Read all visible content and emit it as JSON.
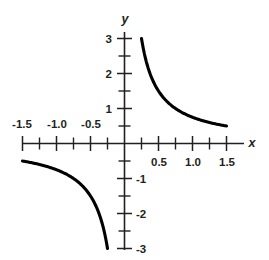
{
  "chart_data": {
    "type": "line",
    "title": "",
    "subtitle": "",
    "xlabel": "x",
    "ylabel": "y",
    "xlim": [
      -1.5,
      1.5
    ],
    "ylim": [
      -3,
      3
    ],
    "grid": false,
    "legend": null,
    "x_tick_labels": [
      "-1.5",
      "-1.0",
      "-0.5",
      "0.5",
      "1.0",
      "1.5"
    ],
    "x_tick_values": [
      -1.5,
      -1.0,
      -0.5,
      0.5,
      1.0,
      1.5
    ],
    "x_tick_label_side": {
      "negative": "above-axis",
      "positive": "below-axis"
    },
    "x_minor_tick_step": 0.25,
    "y_tick_labels": [
      "3",
      "2",
      "1",
      "-1",
      "-2",
      "-3"
    ],
    "y_tick_values": [
      3,
      2,
      1,
      -1,
      -2,
      -3
    ],
    "y_tick_label_side": {
      "positive": "left-of-axis",
      "negative": "right-of-axis"
    },
    "y_minor_tick_step": 0.5,
    "equation": "y = 0.75 / x",
    "constant_k": 0.75,
    "series": [
      {
        "name": "branch-quadrant-I",
        "x": [
          0.25,
          0.3,
          0.35,
          0.4,
          0.45,
          0.5,
          0.6,
          0.7,
          0.8,
          0.9,
          1.0,
          1.1,
          1.2,
          1.3,
          1.4,
          1.5
        ],
        "values": [
          3.0,
          2.5,
          2.14,
          1.88,
          1.67,
          1.5,
          1.25,
          1.07,
          0.94,
          0.83,
          0.75,
          0.68,
          0.63,
          0.58,
          0.54,
          0.5
        ]
      },
      {
        "name": "branch-quadrant-III",
        "x": [
          -1.5,
          -1.4,
          -1.3,
          -1.2,
          -1.1,
          -1.0,
          -0.9,
          -0.8,
          -0.7,
          -0.6,
          -0.5,
          -0.45,
          -0.4,
          -0.35,
          -0.3,
          -0.25
        ],
        "values": [
          -0.5,
          -0.54,
          -0.58,
          -0.63,
          -0.68,
          -0.75,
          -0.83,
          -0.94,
          -1.07,
          -1.25,
          -1.5,
          -1.67,
          -1.88,
          -2.14,
          -2.5,
          -3.0
        ]
      }
    ]
  },
  "labels": {
    "x_axis_name": "x",
    "y_axis_name": "y",
    "x_neg_1_5": "-1.5",
    "x_neg_1_0": "-1.0",
    "x_neg_0_5": "-0.5",
    "x_pos_0_5": "0.5",
    "x_pos_1_0": "1.0",
    "x_pos_1_5": "1.5",
    "y_3": "3",
    "y_2": "2",
    "y_1": "1",
    "y_neg_1": "-1",
    "y_neg_2": "-2",
    "y_neg_3": "-3"
  },
  "colors": {
    "curve": "#000000",
    "axis": "#231f20",
    "background": "#ffffff"
  }
}
